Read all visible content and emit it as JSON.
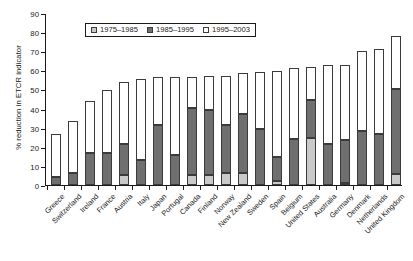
{
  "chart_data": {
    "type": "bar",
    "title": "",
    "subtitle": "",
    "stacked": true,
    "xlabel": "",
    "ylabel": "% reduction in ETCR indicator",
    "ylim": [
      0,
      90
    ],
    "ytick_step": 10,
    "yticks": [
      "0",
      "10",
      "20",
      "30",
      "40",
      "50",
      "60",
      "70",
      "80",
      "90"
    ],
    "grid": false,
    "legend_position": "top-left-inside",
    "categories": [
      "Greece",
      "Switzerland",
      "Ireland",
      "France",
      "Austria",
      "Italy",
      "Japan",
      "Portugal",
      "Canada",
      "Finland",
      "Norway",
      "New Zealand",
      "Sweden",
      "Spain",
      "Belgium",
      "United States",
      "Australia",
      "Germany",
      "Denmark",
      "Netherlands",
      "United Kingdom"
    ],
    "series": [
      {
        "name": "1975–1985",
        "color": "#c9c9c9",
        "values": [
          0,
          0,
          0,
          0,
          5.5,
          0,
          0,
          0,
          5.0,
          5.0,
          6.3,
          6.2,
          0,
          2.0,
          0,
          24.8,
          0,
          1.3,
          0,
          0,
          6.0
        ]
      },
      {
        "name": "1985–1995",
        "color": "#6f6f6f",
        "values": [
          4.1,
          6.3,
          16.8,
          17.0,
          16.0,
          13.2,
          31.2,
          15.8,
          35.3,
          34.3,
          25.2,
          31.2,
          29.5,
          12.7,
          24.0,
          19.6,
          21.4,
          22.5,
          28.3,
          26.5,
          44.5
        ]
      },
      {
        "name": "1995–2003",
        "color": "#ffffff",
        "values": [
          22.6,
          27.3,
          27.3,
          32.7,
          32.5,
          42.4,
          25.4,
          40.9,
          16.4,
          17.5,
          25.4,
          21.0,
          29.4,
          44.8,
          37.3,
          17.2,
          41.2,
          38.9,
          42.0,
          44.6,
          27.6
        ]
      }
    ],
    "totals": [
      26.7,
      33.6,
      44.1,
      49.7,
      54.0,
      55.6,
      56.6,
      56.7,
      56.7,
      56.8,
      56.9,
      58.4,
      58.9,
      59.5,
      61.3,
      61.6,
      62.6,
      62.7,
      70.3,
      71.1,
      78.1
    ]
  },
  "legend": {
    "items": [
      {
        "label": "1975–1985",
        "swatch": "light-gray"
      },
      {
        "label": "1985–1995",
        "swatch": "dark-gray"
      },
      {
        "label": "1995–2003",
        "swatch": "white"
      }
    ]
  }
}
